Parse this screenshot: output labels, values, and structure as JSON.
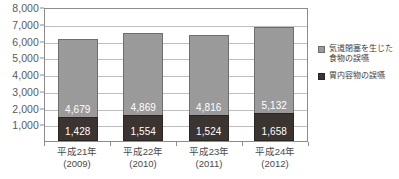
{
  "chart_data": {
    "type": "bar",
    "stacked": true,
    "title": "",
    "xlabel": "",
    "ylabel": "",
    "ylim": [
      0,
      8000
    ],
    "yticks": [
      1000,
      2000,
      3000,
      4000,
      5000,
      6000,
      7000,
      8000
    ],
    "ytick_labels": [
      "1,000",
      "2,000",
      "3,000",
      "4,000",
      "5,000",
      "6,000",
      "7,000",
      "8,000"
    ],
    "grid": true,
    "legend_position": "right",
    "categories": [
      {
        "era": "平成21年",
        "year": "(2009)"
      },
      {
        "era": "平成22年",
        "year": "(2010)"
      },
      {
        "era": "平成23年",
        "year": "(2011)"
      },
      {
        "era": "平成24年",
        "year": "(2012)"
      }
    ],
    "category_labels": [
      "平成21年(2009)",
      "平成22年(2010)",
      "平成23年(2011)",
      "平成24年(2012)"
    ],
    "series": [
      {
        "name": "胃内容物の誤嚥",
        "color": "#3b3430",
        "values": [
          1428,
          1524,
          1524,
          1658
        ],
        "value_labels": [
          "1,428",
          "1,554",
          "1,524",
          "1,658"
        ]
      },
      {
        "name": "気道閉塞を生じた食物の誤嚥",
        "color": "#9a9a9a",
        "values": [
          4679,
          4869,
          4816,
          5132
        ],
        "value_labels": [
          "4,679",
          "4,869",
          "4,816",
          "5,132"
        ]
      }
    ],
    "bars": [
      {
        "category": "平成21年(2009)",
        "bottom_label": "1,428",
        "bottom_value": 1428,
        "top_label": "4,679",
        "top_value": 4679,
        "total": 6107
      },
      {
        "category": "平成22年(2010)",
        "bottom_label": "1,554",
        "bottom_value": 1554,
        "top_label": "4,869",
        "top_value": 4869,
        "total": 6423
      },
      {
        "category": "平成23年(2011)",
        "bottom_label": "1,524",
        "bottom_value": 1524,
        "top_label": "4,816",
        "top_value": 4816,
        "total": 6340
      },
      {
        "category": "平成24年(2012)",
        "bottom_label": "1,658",
        "bottom_value": 1658,
        "top_label": "5,132",
        "top_value": 5132,
        "total": 6790
      }
    ],
    "legend": [
      {
        "label_line1": "気道閉塞を生じた",
        "label_line2": "食物の誤嚥",
        "color": "#9a9a9a"
      },
      {
        "label_line1": "胃内容物の誤嚥",
        "label_line2": "",
        "color": "#3b3430"
      }
    ]
  },
  "colors": {
    "series_top": "#9a9a9a",
    "series_bottom": "#3b3430",
    "gridline": "#bdbdbd",
    "axis": "#8c8c8c",
    "text": "#4a4a4a"
  }
}
